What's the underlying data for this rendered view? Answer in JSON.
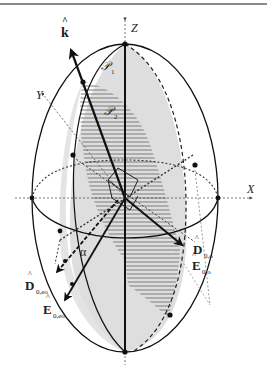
{
  "figure": {
    "axes": {
      "x_label": "X",
      "y_label": "Y",
      "z_label": "Z"
    },
    "planes": {
      "p1": "𝒫",
      "p1_sub": "1",
      "p2": "𝒫",
      "p2_sub": "2"
    },
    "vectors": {
      "k": "k",
      "k_hat": "^",
      "d_o": "D",
      "d_o_sub": "0,o",
      "e_o": "E",
      "e_o_sub": "0,o",
      "d_eo": "D",
      "d_eo_sub": "0,eo",
      "e_eo": "E",
      "e_eo_sub": "0,eo",
      "hat": "^"
    },
    "angle_label": "α",
    "colors": {
      "line": "#111111",
      "plane_fill": "#d9d9d9",
      "hatch": "#7a7a7a",
      "dotted": "#555555",
      "frame": "#8a8a8a"
    }
  }
}
